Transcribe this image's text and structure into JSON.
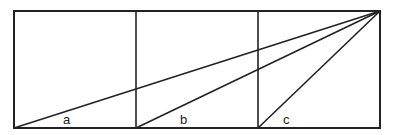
{
  "diagram": {
    "stroke_color": "#222222",
    "background": "#ffffff",
    "outer_rect": {
      "x1": 14,
      "y1": 11,
      "x2": 380,
      "y2": 128
    },
    "dividers": [
      136,
      258
    ],
    "apex": {
      "x": 380,
      "y": 11
    },
    "lines": [
      {
        "from": {
          "x": 14,
          "y": 128
        },
        "label": "a"
      },
      {
        "from": {
          "x": 136,
          "y": 128
        },
        "label": "b"
      },
      {
        "from": {
          "x": 258,
          "y": 128
        },
        "label": "c"
      }
    ],
    "labels": {
      "a": "a",
      "b": "b",
      "c": "c"
    }
  }
}
